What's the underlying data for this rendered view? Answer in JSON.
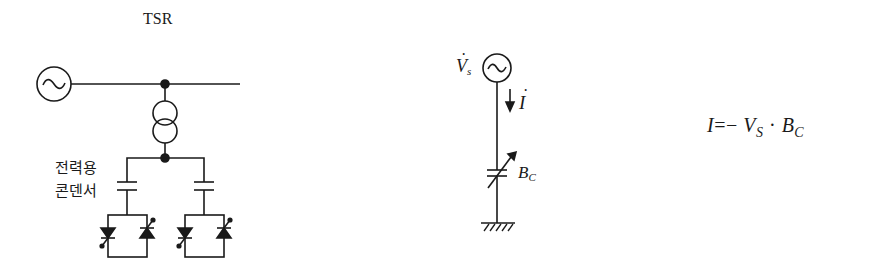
{
  "figure": {
    "left_diagram": {
      "title": "TSR",
      "capacitor_label_line1": "전력용",
      "capacitor_label_line2": "콘덴서",
      "components": [
        "ac-source",
        "bus-line",
        "transformer",
        "capacitor-left",
        "capacitor-right",
        "thyristor-pair-left",
        "thyristor-pair-right"
      ]
    },
    "middle_diagram": {
      "source_label": "V",
      "source_subscript": "s",
      "source_dot": "·",
      "current_label": "I",
      "current_dot": "·",
      "susceptance_label": "B",
      "susceptance_subscript": "C"
    },
    "equation": {
      "lhs": "I",
      "operator": "=− ",
      "v": "V",
      "v_sub": "S",
      "dot": " · ",
      "b": "B",
      "b_sub": "C"
    },
    "colors": {
      "line": "#1a1a1a",
      "background": "#ffffff"
    }
  }
}
